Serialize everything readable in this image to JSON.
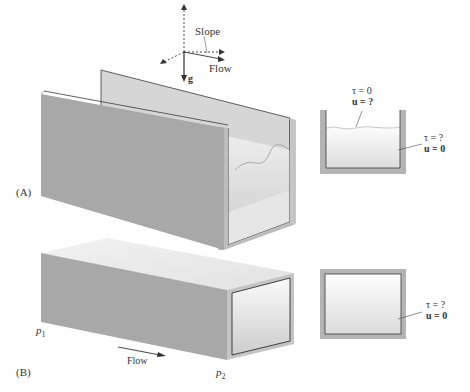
{
  "panel_a": {
    "label": "(A)",
    "axes": {
      "slope_label": "Slope",
      "flow_label": "Flow",
      "gravity_label": "g"
    },
    "cross_section": {
      "free_surface": {
        "tau": "τ = 0",
        "u": "u = ?"
      },
      "wall": {
        "tau": "τ = ?",
        "u": "u = 0"
      }
    }
  },
  "panel_b": {
    "label": "(B)",
    "p1_label": "p",
    "p1_sub": "1",
    "p2_label": "p",
    "p2_sub": "2",
    "flow_label": "Flow",
    "cross_section": {
      "wall": {
        "tau": "τ = ?",
        "u": "u = 0"
      }
    }
  },
  "colors": {
    "wall_gray": "#a9a9a9",
    "wall_light": "#d4d4d4",
    "edge": "#3a3a3a",
    "fluid_top": "#f7f7f7",
    "fluid_bottom": "#d8d8d8"
  }
}
